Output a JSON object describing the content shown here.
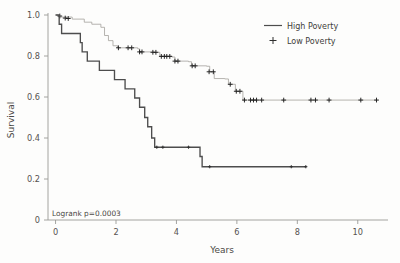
{
  "chart_data": {
    "type": "line",
    "subtype": "kaplan-meier-survival",
    "title": "",
    "xlabel": "Years",
    "ylabel": "Survival",
    "xlim": [
      -0.25,
      11.0
    ],
    "ylim": [
      0,
      1.02
    ],
    "grid": false,
    "xticks": [
      0,
      2,
      4,
      6,
      8,
      10
    ],
    "xticklabels": [
      "0",
      "2",
      "4",
      "6",
      "8",
      "10"
    ],
    "yticks": [
      0,
      0.2,
      0.4,
      0.6,
      0.8,
      1.0
    ],
    "yticklabels": [
      "0",
      "0.2",
      "0.4",
      "0.6",
      "0.8",
      "1.0"
    ],
    "legend": {
      "position": "top-right",
      "entries": [
        {
          "label": "High Poverty",
          "marker": "line",
          "color": "#4d4d4d"
        },
        {
          "label": "Low Poverty",
          "marker": "plus",
          "color": "#2e2e2e"
        }
      ]
    },
    "annotations": [
      {
        "text": "Logrank p=0.0003",
        "x": 0.1,
        "y": 0.035
      }
    ],
    "series": [
      {
        "name": "High Poverty",
        "style": "step-post",
        "color": "#4d4d4d",
        "steps": [
          [
            0.0,
            1.0
          ],
          [
            0.12,
            0.955
          ],
          [
            0.2,
            0.91
          ],
          [
            0.82,
            0.865
          ],
          [
            0.88,
            0.82
          ],
          [
            1.05,
            0.775
          ],
          [
            1.45,
            0.73
          ],
          [
            1.95,
            0.685
          ],
          [
            2.3,
            0.64
          ],
          [
            2.62,
            0.595
          ],
          [
            2.78,
            0.55
          ],
          [
            2.95,
            0.5
          ],
          [
            3.05,
            0.455
          ],
          [
            3.18,
            0.4
          ],
          [
            3.28,
            0.355
          ],
          [
            4.78,
            0.31
          ],
          [
            4.85,
            0.26
          ],
          [
            8.3,
            0.26
          ]
        ],
        "censored": [
          [
            3.35,
            0.355
          ],
          [
            3.55,
            0.355
          ],
          [
            4.4,
            0.355
          ],
          [
            5.1,
            0.26
          ],
          [
            7.8,
            0.26
          ],
          [
            8.28,
            0.26
          ]
        ]
      },
      {
        "name": "Low Poverty",
        "style": "step-post",
        "color": "#a9a6a2",
        "steps": [
          [
            0.0,
            1.0
          ],
          [
            0.1,
            0.99
          ],
          [
            0.55,
            0.98
          ],
          [
            0.95,
            0.965
          ],
          [
            1.2,
            0.955
          ],
          [
            1.5,
            0.94
          ],
          [
            1.62,
            0.9
          ],
          [
            1.75,
            0.875
          ],
          [
            1.9,
            0.85
          ],
          [
            2.05,
            0.84
          ],
          [
            2.72,
            0.835
          ],
          [
            2.78,
            0.82
          ],
          [
            3.25,
            0.818
          ],
          [
            3.45,
            0.8
          ],
          [
            3.85,
            0.795
          ],
          [
            3.95,
            0.775
          ],
          [
            4.4,
            0.772
          ],
          [
            4.5,
            0.752
          ],
          [
            5.0,
            0.75
          ],
          [
            5.1,
            0.723
          ],
          [
            5.25,
            0.69
          ],
          [
            5.6,
            0.688
          ],
          [
            5.72,
            0.662
          ],
          [
            5.95,
            0.628
          ],
          [
            6.2,
            0.585
          ],
          [
            10.65,
            0.585
          ]
        ],
        "censored": [
          [
            0.14,
            0.995
          ],
          [
            0.32,
            0.985
          ],
          [
            0.42,
            0.983
          ],
          [
            2.08,
            0.84
          ],
          [
            2.4,
            0.84
          ],
          [
            2.52,
            0.84
          ],
          [
            2.78,
            0.82
          ],
          [
            2.86,
            0.82
          ],
          [
            3.22,
            0.818
          ],
          [
            3.32,
            0.818
          ],
          [
            3.5,
            0.798
          ],
          [
            3.6,
            0.798
          ],
          [
            3.68,
            0.798
          ],
          [
            3.78,
            0.798
          ],
          [
            3.95,
            0.775
          ],
          [
            4.05,
            0.775
          ],
          [
            4.52,
            0.752
          ],
          [
            4.62,
            0.752
          ],
          [
            5.08,
            0.723
          ],
          [
            5.22,
            0.723
          ],
          [
            5.78,
            0.662
          ],
          [
            5.98,
            0.628
          ],
          [
            6.1,
            0.628
          ],
          [
            6.25,
            0.585
          ],
          [
            6.45,
            0.585
          ],
          [
            6.55,
            0.585
          ],
          [
            6.65,
            0.585
          ],
          [
            6.82,
            0.585
          ],
          [
            7.55,
            0.585
          ],
          [
            8.45,
            0.585
          ],
          [
            8.6,
            0.585
          ],
          [
            9.05,
            0.585
          ],
          [
            10.1,
            0.585
          ],
          [
            10.62,
            0.585
          ]
        ]
      }
    ]
  },
  "axes": {
    "x_title": "Years",
    "y_title": "Survival"
  }
}
